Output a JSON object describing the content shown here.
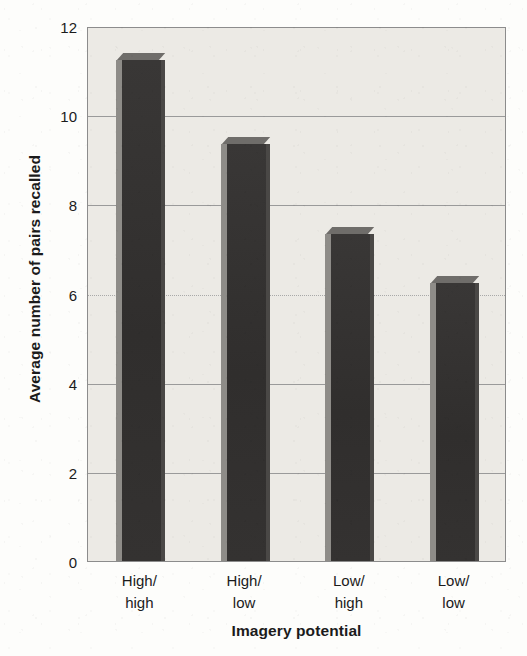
{
  "chart_data": {
    "type": "bar",
    "title": "",
    "subtitle": "",
    "categories": [
      "High/\nhigh",
      "High/\nlow",
      "Low/\nhigh",
      "Low/\nlow"
    ],
    "category_lines": [
      [
        "High/",
        "high"
      ],
      [
        "High/",
        "low"
      ],
      [
        "Low/",
        "high"
      ],
      [
        "Low/",
        "low"
      ]
    ],
    "values": [
      11.4,
      9.5,
      7.5,
      6.4
    ],
    "xlabel": "Imagery potential",
    "ylabel": "Average number of pairs recalled",
    "ylim": [
      0,
      12
    ],
    "yticks": [
      0,
      2,
      4,
      6,
      8,
      10,
      12
    ],
    "ytick_labels": [
      "0",
      "2",
      "4",
      "6",
      "8",
      "10",
      "12"
    ],
    "grid": true,
    "legend": null,
    "annotations": [],
    "style": "3d-bars",
    "colors": {
      "bar_front": "#333131",
      "bar_side": "#8e8c88",
      "bar_top": "#6f6d6a",
      "plot_background": "#eceae5",
      "gridline": "#9a9a9a",
      "axis": "#8c8c8c",
      "text": "#1b1b1b"
    }
  }
}
